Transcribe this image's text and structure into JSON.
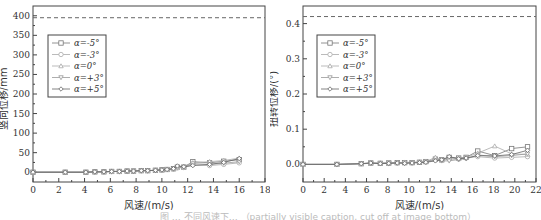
{
  "caption": "图 … 不同风速下… （partially visible caption, cut off at image bottom）",
  "legend": [
    "α=-5°",
    "α=-3°",
    "α=0°",
    "α=+3°",
    "α=+5°"
  ],
  "series_styles": [
    {
      "marker": "square",
      "color": "#777777"
    },
    {
      "marker": "circle",
      "color": "#aaaaaa"
    },
    {
      "marker": "triangle-up",
      "color": "#aaaaaa"
    },
    {
      "marker": "triangle-down",
      "color": "#999999"
    },
    {
      "marker": "diamond",
      "color": "#666666"
    }
  ],
  "chart_data": [
    {
      "type": "line",
      "title": "",
      "xlabel": "风速/(m/s)",
      "ylabel": "竖向位移/mm",
      "xlim": [
        0,
        18
      ],
      "ylim": [
        -25,
        425
      ],
      "xticks": [
        0,
        2,
        4,
        6,
        8,
        10,
        12,
        14,
        16,
        18
      ],
      "yticks": [
        0,
        50,
        100,
        150,
        200,
        250,
        300,
        350,
        400
      ],
      "reference_line": {
        "y": 395,
        "style": "dashed"
      },
      "legend_position": "upper-left",
      "grid": false,
      "x": [
        0,
        2.5,
        4.1,
        4.8,
        5.5,
        6.1,
        6.7,
        7.3,
        7.8,
        8.4,
        8.9,
        9.5,
        10.0,
        10.4,
        10.9,
        11.2,
        11.7,
        12.4,
        13.7,
        14.8,
        16.0
      ],
      "series": [
        {
          "name": "α=-5°",
          "values": [
            0,
            0,
            0,
            1,
            1,
            2,
            2,
            3,
            3,
            4,
            4,
            5,
            6,
            7,
            9,
            13,
            13,
            27,
            24,
            28,
            32
          ]
        },
        {
          "name": "α=-3°",
          "values": [
            0,
            0,
            0,
            1,
            1,
            2,
            2,
            3,
            3,
            4,
            4,
            5,
            6,
            7,
            8,
            11,
            12,
            19,
            17,
            20,
            24
          ]
        },
        {
          "name": "α=0°",
          "values": [
            0,
            0,
            0,
            1,
            1,
            2,
            2,
            3,
            3,
            4,
            4,
            5,
            6,
            7,
            9,
            14,
            15,
            24,
            27,
            30,
            36
          ]
        },
        {
          "name": "α=+3°",
          "values": [
            0,
            0,
            0,
            1,
            1,
            2,
            2,
            3,
            3,
            4,
            4,
            5,
            6,
            7,
            8,
            12,
            13,
            22,
            20,
            23,
            27
          ]
        },
        {
          "name": "α=+5°",
          "values": [
            0,
            0,
            0,
            1,
            1,
            2,
            2,
            3,
            3,
            4,
            4,
            5,
            6,
            7,
            9,
            16,
            14,
            17,
            20,
            25,
            35
          ]
        }
      ]
    },
    {
      "type": "line",
      "title": "",
      "xlabel": "风速/(m/s)",
      "ylabel": "扭转位移/(°)",
      "xlim": [
        0,
        22
      ],
      "ylim": [
        -0.05,
        0.45
      ],
      "xticks": [
        0,
        2,
        4,
        6,
        8,
        10,
        12,
        14,
        16,
        18,
        20,
        22
      ],
      "yticks": [
        0.0,
        0.1,
        0.2,
        0.3,
        0.4
      ],
      "ytick_labels": [
        "0.0",
        "0.1",
        "0.2",
        "0.3",
        "0.4"
      ],
      "reference_line": {
        "y": 0.42,
        "style": "dashed"
      },
      "legend_position": "upper-left",
      "grid": false,
      "x": [
        0,
        3.2,
        5.5,
        6.4,
        7.3,
        8.1,
        8.9,
        9.6,
        10.3,
        11.0,
        11.6,
        12.5,
        13.1,
        13.8,
        14.7,
        15.4,
        16.5,
        18.1,
        19.7,
        21.2
      ],
      "series": [
        {
          "name": "α=-5°",
          "values": [
            0,
            0,
            0.002,
            0.004,
            0.003,
            0.004,
            0.005,
            0.005,
            0.005,
            0.006,
            0.008,
            0.015,
            0.013,
            0.02,
            0.018,
            0.02,
            0.038,
            0.025,
            0.045,
            0.05
          ]
        },
        {
          "name": "α=-3°",
          "values": [
            0,
            0,
            0.002,
            0.003,
            0.003,
            0.004,
            0.004,
            0.005,
            0.005,
            0.006,
            0.007,
            0.013,
            0.012,
            0.015,
            0.015,
            0.018,
            0.022,
            0.018,
            0.02,
            0.022
          ]
        },
        {
          "name": "α=0°",
          "values": [
            0,
            0,
            0.002,
            0.004,
            0.004,
            0.004,
            0.005,
            0.006,
            0.006,
            0.007,
            0.008,
            0.02,
            0.014,
            0.018,
            0.017,
            0.02,
            0.032,
            0.052,
            0.03,
            0.028
          ]
        },
        {
          "name": "α=+3°",
          "values": [
            0,
            0,
            0.002,
            0.003,
            0.003,
            0.004,
            0.004,
            0.005,
            0.005,
            0.006,
            0.007,
            0.012,
            0.01,
            0.01,
            0.014,
            0.016,
            0.027,
            0.022,
            0.025,
            0.03
          ]
        },
        {
          "name": "α=+5°",
          "values": [
            0,
            0,
            0.002,
            0.004,
            0.002,
            0.003,
            0.004,
            0.003,
            0.004,
            0.005,
            0.006,
            0.01,
            0.013,
            0.022,
            0.016,
            0.018,
            0.025,
            0.024,
            0.028,
            0.04
          ]
        }
      ]
    }
  ]
}
